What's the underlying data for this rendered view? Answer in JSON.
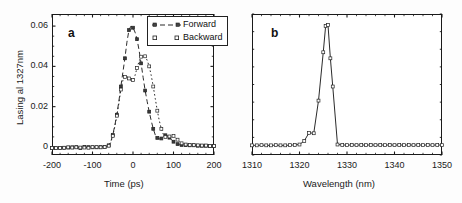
{
  "figure": {
    "panels": [
      "a",
      "b"
    ],
    "background": "#ffffff",
    "line_color": "#2b2b2b"
  },
  "panel_a": {
    "letter": "a",
    "legend": {
      "forward_label": "Forward",
      "backward_label": "Backward"
    }
  },
  "panel_b": {
    "letter": "b"
  },
  "chart_data": [
    {
      "type": "line",
      "panel": "a",
      "title": "",
      "xlabel": "Time (ps)",
      "ylabel": "Lasing al 1327nm",
      "xlim": [
        -200,
        200
      ],
      "ylim": [
        -0.004,
        0.066
      ],
      "xticks": [
        -200,
        -100,
        0,
        100,
        200
      ],
      "xticklabels": [
        "-200",
        "-100",
        "0",
        "100",
        "200"
      ],
      "yticks": [
        0,
        0.02,
        0.04,
        0.06
      ],
      "yticklabels": [
        "0",
        "0.02",
        "0.04",
        "0.06"
      ],
      "grid": false,
      "legend": [
        "Forward",
        "Backward"
      ],
      "legend_position": "upper right",
      "x": [
        -200,
        -195,
        -190,
        -185,
        -180,
        -175,
        -170,
        -165,
        -160,
        -155,
        -150,
        -145,
        -140,
        -135,
        -130,
        -125,
        -120,
        -115,
        -110,
        -105,
        -100,
        -95,
        -90,
        -85,
        -80,
        -75,
        -70,
        -65,
        -60,
        -55,
        -50,
        -45,
        -40,
        -35,
        -30,
        -25,
        -20,
        -15,
        -10,
        -5,
        0,
        5,
        10,
        15,
        20,
        25,
        30,
        35,
        40,
        45,
        50,
        55,
        60,
        65,
        70,
        75,
        80,
        85,
        90,
        95,
        100,
        105,
        110,
        115,
        120,
        125,
        130,
        135,
        140,
        145,
        150,
        155,
        160,
        165,
        170,
        175,
        180,
        185,
        190,
        195,
        200
      ],
      "series": [
        {
          "name": "Forward",
          "linestyle": "dashed",
          "marker": "square",
          "values": [
            -0.0005,
            -0.0004,
            -0.0006,
            -0.0003,
            -0.0005,
            -0.0002,
            -0.0004,
            -0.0006,
            -0.0003,
            -0.0005,
            -0.0002,
            -0.0004,
            -0.0001,
            -0.0003,
            -0.0005,
            -0.0002,
            0.0,
            -0.0003,
            -0.0001,
            -0.0004,
            -0.0002,
            0.0,
            -0.0002,
            0.0001,
            -0.0001,
            0.0002,
            0.0,
            0.0003,
            0.0008,
            0.0025,
            0.006,
            0.0105,
            0.016,
            0.0225,
            0.03,
            0.037,
            0.044,
            0.052,
            0.058,
            0.06,
            0.0592,
            0.057,
            0.0535,
            0.048,
            0.0415,
            0.0345,
            0.028,
            0.0225,
            0.0175,
            0.013,
            0.009,
            0.006,
            0.0045,
            0.004,
            0.0042,
            0.0052,
            0.0058,
            0.0055,
            0.0046,
            0.0036,
            0.0026,
            0.0018,
            0.0014,
            0.0011,
            0.001,
            0.0009,
            0.0009,
            0.0008,
            0.0008,
            0.0007,
            0.0008,
            0.0007,
            0.0006,
            0.0007,
            0.0006,
            0.0005,
            0.0006,
            0.0005,
            0.0004,
            0.0005,
            0.0004
          ]
        },
        {
          "name": "Backward",
          "linestyle": "dotted",
          "marker": "open-square",
          "values": [
            -0.0005,
            -0.0003,
            -0.0006,
            -0.0004,
            -0.0005,
            -0.0003,
            -0.0004,
            -0.0005,
            -0.0002,
            -0.0004,
            -0.0003,
            -0.0005,
            -0.0002,
            -0.0004,
            -0.0003,
            -0.0001,
            -0.0003,
            -0.0002,
            -0.0004,
            -0.0002,
            -0.0001,
            -0.0003,
            -0.0001,
            0.0,
            -0.0002,
            0.0001,
            -0.0001,
            0.0002,
            0.0006,
            0.0022,
            0.0055,
            0.01,
            0.0155,
            0.0215,
            0.0285,
            0.033,
            0.0348,
            0.0352,
            0.034,
            0.033,
            0.0332,
            0.0355,
            0.0392,
            0.0425,
            0.0448,
            0.0455,
            0.045,
            0.043,
            0.04,
            0.0355,
            0.03,
            0.024,
            0.018,
            0.013,
            0.009,
            0.0062,
            0.005,
            0.0048,
            0.0052,
            0.0058,
            0.0055,
            0.0046,
            0.0036,
            0.0026,
            0.0018,
            0.0014,
            0.0012,
            0.0011,
            0.001,
            0.0009,
            0.0009,
            0.0008,
            0.0008,
            0.0007,
            0.0007,
            0.0006,
            0.0007,
            0.0006,
            0.0005,
            0.0006,
            0.0005
          ]
        }
      ]
    },
    {
      "type": "line",
      "panel": "b",
      "title": "",
      "xlabel": "Wavelength (nm)",
      "ylabel": "",
      "xlim": [
        1310,
        1350
      ],
      "ylim": [
        -0.004,
        0.066
      ],
      "xticks": [
        1310,
        1320,
        1330,
        1340,
        1350
      ],
      "xticklabels": [
        "1310",
        "1320",
        "1330",
        "1340",
        "1350"
      ],
      "grid": false,
      "legend": [],
      "x": [
        1310,
        1311,
        1312,
        1313,
        1314,
        1315,
        1316,
        1317,
        1318,
        1319,
        1320,
        1321,
        1322,
        1323,
        1324,
        1325,
        1325.5,
        1326,
        1326.5,
        1327,
        1328,
        1329,
        1330,
        1331,
        1332,
        1333,
        1334,
        1335,
        1336,
        1337,
        1338,
        1339,
        1340,
        1341,
        1342,
        1343,
        1344,
        1345,
        1346,
        1347,
        1348,
        1349,
        1350
      ],
      "series": [
        {
          "name": "Spectrum",
          "linestyle": "solid",
          "marker": "open-square",
          "values": [
            0.0008,
            0.0008,
            0.0009,
            0.0008,
            0.0008,
            0.0009,
            0.0008,
            0.0008,
            0.0009,
            0.001,
            0.0012,
            0.003,
            0.007,
            0.0068,
            0.023,
            0.047,
            0.06,
            0.0605,
            0.044,
            0.03,
            0.0012,
            0.001,
            0.0009,
            0.001,
            0.0009,
            0.001,
            0.0009,
            0.001,
            0.0009,
            0.001,
            0.0009,
            0.001,
            0.0009,
            0.001,
            0.0009,
            0.001,
            0.0009,
            0.001,
            0.0009,
            0.001,
            0.0009,
            0.001,
            0.0009
          ]
        }
      ]
    }
  ]
}
